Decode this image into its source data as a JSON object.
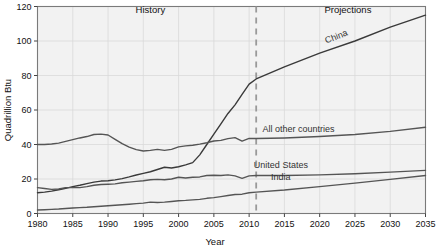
{
  "chart_data": {
    "type": "line",
    "title": "",
    "xlabel": "Year",
    "ylabel": "Quadrillion Btu",
    "xlim": [
      1980,
      2035
    ],
    "ylim": [
      0,
      120
    ],
    "ytick_labels": [
      "0",
      "20",
      "40",
      "60",
      "80",
      "100",
      "120"
    ],
    "yticks": [
      0,
      20,
      40,
      60,
      80,
      100,
      120
    ],
    "xtick_labels": [
      "1980",
      "1985",
      "1990",
      "1995",
      "2000",
      "2005",
      "2010",
      "2015",
      "2020",
      "2025",
      "2030",
      "2035"
    ],
    "xticks": [
      1980,
      1985,
      1990,
      1995,
      2000,
      2005,
      2010,
      2015,
      2020,
      2025,
      2030,
      2035
    ],
    "grid": true,
    "legend_position": "inline-labels",
    "annotations": [
      {
        "text": "History",
        "x": 1996,
        "y": 116
      },
      {
        "text": "Projections",
        "x": 2024,
        "y": 116
      }
    ],
    "divider": {
      "x": 2011,
      "style": "dashed",
      "color": "#999999"
    },
    "series": [
      {
        "name": "China",
        "label": "China",
        "color": "#3a3a3a",
        "label_x": 2022.5,
        "label_y": 101,
        "label_rotate": -21,
        "x": [
          1980,
          1981,
          1982,
          1983,
          1984,
          1985,
          1986,
          1987,
          1988,
          1989,
          1990,
          1991,
          1992,
          1993,
          1994,
          1995,
          1996,
          1997,
          1998,
          1999,
          2000,
          2001,
          2002,
          2003,
          2004,
          2005,
          2006,
          2007,
          2008,
          2009,
          2010,
          2011,
          2015,
          2020,
          2025,
          2030,
          2035
        ],
        "values": [
          12,
          12.4,
          13,
          13.8,
          14.6,
          15.6,
          16.4,
          17.3,
          18.2,
          18.8,
          19,
          19.5,
          20.2,
          21.2,
          22.3,
          23.3,
          24.2,
          25.5,
          26.8,
          26.4,
          27.1,
          28.2,
          29.5,
          34,
          40,
          46,
          52,
          58,
          63,
          69,
          75,
          78,
          85,
          93,
          100,
          108,
          115
        ]
      },
      {
        "name": "All other countries",
        "label": "All other countries",
        "color": "#555555",
        "label_x": 2017,
        "label_y": 47,
        "label_rotate": 0,
        "x": [
          1980,
          1981,
          1982,
          1983,
          1984,
          1985,
          1986,
          1987,
          1988,
          1989,
          1990,
          1991,
          1992,
          1993,
          1994,
          1995,
          1996,
          1997,
          1998,
          1999,
          2000,
          2001,
          2002,
          2003,
          2004,
          2005,
          2006,
          2007,
          2008,
          2009,
          2010,
          2011,
          2015,
          2020,
          2025,
          2030,
          2035
        ],
        "values": [
          40,
          40,
          40.3,
          40.8,
          41.8,
          42.8,
          43.8,
          44.6,
          45.8,
          46,
          45.5,
          43,
          40.5,
          38.5,
          37,
          36.2,
          36.6,
          37.2,
          36.6,
          37.2,
          38.6,
          39.2,
          39.6,
          40.2,
          41,
          42,
          42.4,
          43.4,
          44,
          42,
          43.5,
          43.5,
          43.8,
          44.6,
          45.8,
          47.6,
          50
        ]
      },
      {
        "name": "United States",
        "label": "United States",
        "color": "#555555",
        "label_x": 2014.5,
        "label_y": 26.5,
        "label_rotate": 0,
        "x": [
          1980,
          1981,
          1982,
          1983,
          1984,
          1985,
          1986,
          1987,
          1988,
          1989,
          1990,
          1991,
          1992,
          1993,
          1994,
          1995,
          1996,
          1997,
          1998,
          1999,
          2000,
          2001,
          2002,
          2003,
          2004,
          2005,
          2006,
          2007,
          2008,
          2009,
          2010,
          2011,
          2015,
          2020,
          2025,
          2030,
          2035
        ],
        "values": [
          15,
          14.5,
          14,
          14.2,
          15,
          15,
          15,
          15.6,
          16.4,
          16.8,
          17,
          17.2,
          17.8,
          18.2,
          18.6,
          19,
          19.6,
          19.8,
          19.6,
          20,
          21,
          20.6,
          21,
          21.2,
          22,
          22.2,
          22,
          22.4,
          21.8,
          20.4,
          21.8,
          22,
          22,
          22.4,
          23,
          24,
          25
        ]
      },
      {
        "name": "India",
        "label": "India",
        "color": "#555555",
        "label_x": 2014.5,
        "label_y": 19.5,
        "label_rotate": 0,
        "x": [
          1980,
          1981,
          1982,
          1983,
          1984,
          1985,
          1986,
          1987,
          1988,
          1989,
          1990,
          1991,
          1992,
          1993,
          1994,
          1995,
          1996,
          1997,
          1998,
          1999,
          2000,
          2001,
          2002,
          2003,
          2004,
          2005,
          2006,
          2007,
          2008,
          2009,
          2010,
          2011,
          2015,
          2020,
          2025,
          2030,
          2035
        ],
        "values": [
          2,
          2.2,
          2.4,
          2.6,
          2.9,
          3.2,
          3.4,
          3.6,
          3.9,
          4.2,
          4.5,
          4.8,
          5.1,
          5.4,
          5.7,
          6,
          6.6,
          6.4,
          6.6,
          7,
          7.4,
          7.6,
          7.9,
          8.2,
          8.8,
          9.2,
          9.8,
          10.4,
          11,
          11.2,
          12,
          12.4,
          13.6,
          15.6,
          17.6,
          19.8,
          22
        ]
      }
    ]
  }
}
